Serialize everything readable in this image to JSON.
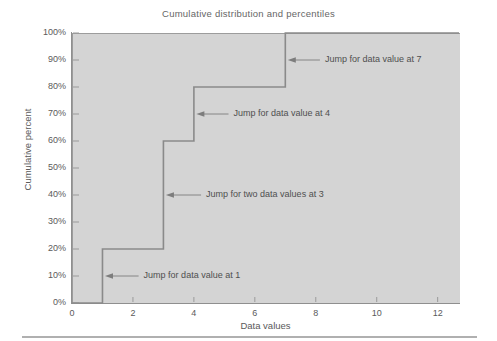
{
  "figure": {
    "title": "Cumulative distribution and percentiles",
    "background_color": "#ffffff",
    "plot_background_color": "#d4d4d4",
    "line_color": "#8a8a8a",
    "text_color": "#555555"
  },
  "chart_data": {
    "type": "line",
    "title": "Cumulative distribution and percentiles",
    "xlabel": "Data values",
    "ylabel": "Cumulative percent",
    "xlim": [
      0,
      12.7
    ],
    "ylim": [
      0,
      100
    ],
    "grid": false,
    "legend": null,
    "xticks": [
      0,
      2,
      4,
      6,
      8,
      10,
      12
    ],
    "xtick_labels": [
      "0",
      "2",
      "4",
      "6",
      "8",
      "10",
      "12"
    ],
    "yticks": [
      0,
      10,
      20,
      30,
      40,
      50,
      60,
      70,
      80,
      90,
      100
    ],
    "ytick_labels": [
      "0%",
      "10%",
      "20%",
      "30%",
      "40%",
      "50%",
      "60%",
      "70%",
      "80%",
      "90%",
      "100%"
    ],
    "series": [
      {
        "name": "Cumulative distribution (step)",
        "drawstyle": "steps-post",
        "x": [
          0,
          1,
          1,
          3,
          3,
          4,
          4,
          7,
          7,
          12.7
        ],
        "y": [
          0,
          0,
          20,
          20,
          60,
          60,
          80,
          80,
          100,
          100
        ],
        "jumps": [
          {
            "x": 1,
            "from": 0,
            "to": 20,
            "count": 1
          },
          {
            "x": 3,
            "from": 20,
            "to": 60,
            "count": 2
          },
          {
            "x": 4,
            "from": 60,
            "to": 80,
            "count": 1
          },
          {
            "x": 7,
            "from": 80,
            "to": 100,
            "count": 1
          }
        ]
      }
    ],
    "annotations": [
      {
        "id": "jump-at-7",
        "text": "Jump for data value at 7",
        "arrow_tip_x": 7,
        "arrow_tip_y": 90,
        "text_x": 8.3,
        "text_y": 90
      },
      {
        "id": "jump-at-4",
        "text": "Jump for data value at 4",
        "arrow_tip_x": 4,
        "arrow_tip_y": 70,
        "text_x": 5.3,
        "text_y": 70
      },
      {
        "id": "jump-at-3",
        "text": "Jump for two data values at 3",
        "arrow_tip_x": 3,
        "arrow_tip_y": 40,
        "text_x": 4.4,
        "text_y": 40
      },
      {
        "id": "jump-at-1",
        "text": "Jump for data value at 1",
        "arrow_tip_x": 1,
        "arrow_tip_y": 10,
        "text_x": 2.35,
        "text_y": 10
      }
    ]
  }
}
